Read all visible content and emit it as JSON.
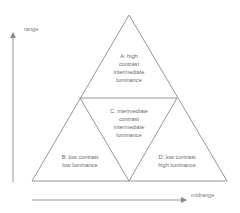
{
  "axes": {
    "y_label": "range",
    "x_label": "midrange"
  },
  "regions": [
    {
      "id": "A",
      "lines": [
        "A: high",
        "contrast",
        "intermediate",
        "luminance"
      ]
    },
    {
      "id": "B",
      "lines": [
        "B: low contrast",
        "low luminance"
      ]
    },
    {
      "id": "C",
      "lines": [
        "C: intermediate",
        "contrast",
        "intermediate",
        "luminance"
      ]
    },
    {
      "id": "D",
      "lines": [
        "D: low contrast",
        "high luminance"
      ]
    }
  ],
  "colors": {
    "line": "#8a8a8a",
    "text": "#6a6a6a",
    "background": "#ffffff"
  }
}
